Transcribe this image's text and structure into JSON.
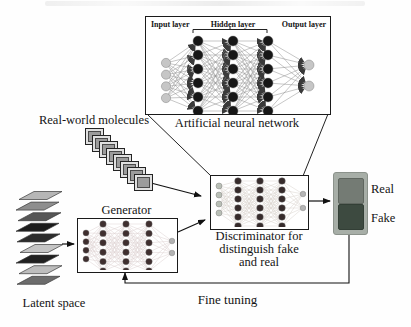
{
  "figure": {
    "ann": {
      "input_label": "Input layer",
      "hidden_label": "Hidden layer",
      "output_label": "Output layer",
      "caption": "Artificial neural network"
    },
    "molecules": {
      "label": "Real-world molecules",
      "tile_count": 8
    },
    "latent": {
      "label": "Latent space",
      "layer_colors": [
        "#b6b6b6",
        "#8e8e8e",
        "#565656",
        "#1c1c1c",
        "#2c2c2c",
        "#c4c4c4",
        "#202020",
        "#bdbdbd",
        "#6c6c6c"
      ]
    },
    "generator": {
      "label": "Generator"
    },
    "discriminator": {
      "caption_lines": [
        "Discriminator for",
        "distinguish fake",
        "and real"
      ]
    },
    "classification": {
      "real_label": "Real",
      "fake_label": "Fake",
      "panel_bg": "#a7aea7",
      "real_swatch": "#747b74",
      "fake_swatch": "#3d4a40"
    },
    "feedback": {
      "label": "Fine tuning"
    }
  },
  "networks": {
    "ann": {
      "layer_sizes": [
        4,
        6,
        6,
        6,
        2
      ],
      "node_colors": [
        "#c6c6c6",
        "#171717",
        "#171717",
        "#171717",
        "#c6c6c6"
      ],
      "line_color": "#8f8f8f"
    },
    "generator": {
      "layer_sizes": [
        4,
        6,
        6,
        6,
        2
      ],
      "node_colors": [
        "#3f2f2f",
        "#3f2f2f",
        "#3f2f2f",
        "#3f2f2f",
        "#b3b3b3"
      ],
      "line_color": "#ddd0d0"
    },
    "discriminator": {
      "layer_sizes": [
        4,
        6,
        6,
        6,
        2
      ],
      "node_colors": [
        "#b9bfb6",
        "#362b2b",
        "#362b2b",
        "#362b2b",
        "#b5b5b5"
      ],
      "line_color": "#d8d3cc"
    }
  }
}
